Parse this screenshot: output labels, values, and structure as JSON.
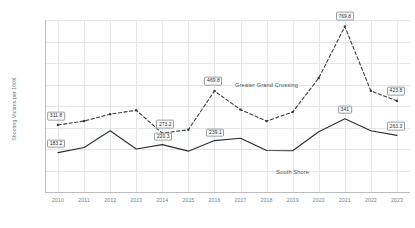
{
  "chart_data": {
    "type": "line",
    "title": "",
    "xlabel": "",
    "ylabel": "Shooting Victims per 100K",
    "ylim": [
      0,
      800
    ],
    "ytick_step": 100,
    "grid": true,
    "legend_position": "inline-annotation",
    "categories": [
      "2010",
      "2011",
      "2012",
      "2013",
      "2014",
      "2015",
      "2016",
      "2017",
      "2018",
      "2019",
      "2020",
      "2021",
      "2022",
      "2023"
    ],
    "series": [
      {
        "name": "Greater Grand Crossing",
        "style": "dashed",
        "color": "#3a3d41",
        "values": [
          311.8,
          330.0,
          362.0,
          380.0,
          273.2,
          290.0,
          469.8,
          383.0,
          330.0,
          372.0,
          530.0,
          769.8,
          470.0,
          423.8
        ]
      },
      {
        "name": "South Shore",
        "style": "solid",
        "color": "#2b2d30",
        "values": [
          183.2,
          207.0,
          285.0,
          200.0,
          220.3,
          190.0,
          239.1,
          250.0,
          193.0,
          192.0,
          280.0,
          341.0,
          285.0,
          263.3
        ]
      }
    ],
    "ytick_labels": [
      "0",
      "100",
      "200",
      "300",
      "400",
      "500",
      "600",
      "700",
      "800"
    ],
    "data_labels": [
      {
        "series": "Greater Grand Crossing",
        "category": "2010",
        "value": 311.8,
        "text": "311.8"
      },
      {
        "series": "Greater Grand Crossing",
        "category": "2014",
        "value": 273.2,
        "text": "273.2"
      },
      {
        "series": "Greater Grand Crossing",
        "category": "2016",
        "value": 469.8,
        "text": "469.8"
      },
      {
        "series": "Greater Grand Crossing",
        "category": "2021",
        "value": 769.8,
        "text": "769.8"
      },
      {
        "series": "Greater Grand Crossing",
        "category": "2023",
        "value": 423.8,
        "text": "423.8"
      },
      {
        "series": "South Shore",
        "category": "2010",
        "value": 183.2,
        "text": "183.2"
      },
      {
        "series": "South Shore",
        "category": "2014",
        "value": 220.3,
        "text": "220.3"
      },
      {
        "series": "South Shore",
        "category": "2016",
        "value": 239.1,
        "text": "239.1"
      },
      {
        "series": "South Shore",
        "category": "2021",
        "value": 341.0,
        "text": "341"
      },
      {
        "series": "South Shore",
        "category": "2023",
        "value": 263.3,
        "text": "263.3"
      }
    ],
    "annotations": [
      {
        "text": "Greater Grand Crossing",
        "category": "2018",
        "value": 500
      },
      {
        "text": "South Shore",
        "category": "2019",
        "value": 95
      }
    ]
  }
}
